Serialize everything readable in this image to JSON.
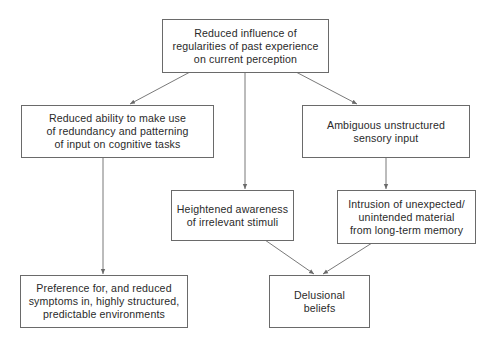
{
  "diagram": {
    "nodes": [
      {
        "id": "reduced-influence",
        "lines": [
          "Reduced influence of",
          "regularities of past experience",
          "on current perception"
        ]
      },
      {
        "id": "reduced-ability",
        "lines": [
          "Reduced ability to make use",
          "of redundancy and patterning",
          "of input on cognitive tasks"
        ]
      },
      {
        "id": "ambiguous-input",
        "lines": [
          "Ambiguous unstructured",
          "sensory input"
        ]
      },
      {
        "id": "heightened-awareness",
        "lines": [
          "Heightened awareness",
          "of irrelevant stimuli"
        ]
      },
      {
        "id": "intrusion",
        "lines": [
          "Intrusion of unexpected/",
          "unintended material",
          "from long-term memory"
        ]
      },
      {
        "id": "preference",
        "lines": [
          "Preference for, and reduced",
          "symptoms in, highly structured,",
          "predictable environments"
        ]
      },
      {
        "id": "delusional-beliefs",
        "lines": [
          "Delusional",
          "beliefs"
        ]
      }
    ],
    "edges": [
      {
        "from": "reduced-influence",
        "to": "reduced-ability"
      },
      {
        "from": "reduced-influence",
        "to": "heightened-awareness"
      },
      {
        "from": "reduced-influence",
        "to": "ambiguous-input"
      },
      {
        "from": "reduced-ability",
        "to": "preference"
      },
      {
        "from": "ambiguous-input",
        "to": "intrusion"
      },
      {
        "from": "heightened-awareness",
        "to": "delusional-beliefs"
      },
      {
        "from": "intrusion",
        "to": "delusional-beliefs"
      }
    ],
    "colors": {
      "line": "#6a6a6a",
      "text": "#2a2a2a",
      "background": "#ffffff"
    }
  }
}
